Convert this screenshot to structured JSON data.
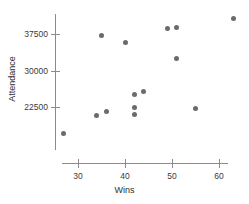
{
  "chart_data": {
    "type": "scatter",
    "title": "",
    "xlabel": "Wins",
    "ylabel": "Attendance",
    "xlim": [
      25,
      64
    ],
    "ylim": [
      15000,
      42000
    ],
    "xticks": [
      30,
      40,
      50,
      60
    ],
    "xtick_labels": [
      "30",
      "40",
      "50",
      "60"
    ],
    "yticks": [
      22500,
      30000,
      37500
    ],
    "ytick_labels": [
      "22500",
      "30000",
      "37500"
    ],
    "grid": false,
    "legend": null,
    "marker_color": "#6a6a70",
    "axis_color": "#8a8a90",
    "points": [
      {
        "x": 27,
        "y": 17000
      },
      {
        "x": 34,
        "y": 20800
      },
      {
        "x": 35,
        "y": 37200
      },
      {
        "x": 36,
        "y": 21600
      },
      {
        "x": 40,
        "y": 35800
      },
      {
        "x": 42,
        "y": 22400
      },
      {
        "x": 42,
        "y": 20900
      },
      {
        "x": 42,
        "y": 25000
      },
      {
        "x": 44,
        "y": 25600
      },
      {
        "x": 49,
        "y": 38700
      },
      {
        "x": 51,
        "y": 38900
      },
      {
        "x": 51,
        "y": 32400
      },
      {
        "x": 55,
        "y": 22200
      },
      {
        "x": 63,
        "y": 40600
      }
    ]
  }
}
